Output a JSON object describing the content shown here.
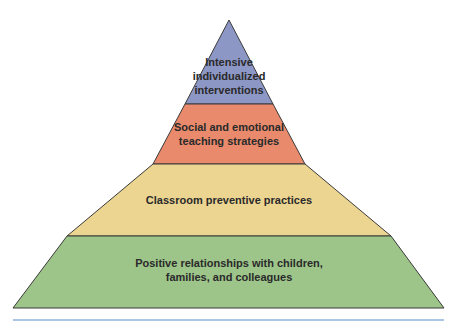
{
  "diagram": {
    "type": "pyramid",
    "tiers": [
      {
        "label_line1": "Intensive",
        "label_line2": "individualized",
        "label_line3": "interventions",
        "color": "#8d97c6"
      },
      {
        "label_line1": "Social and emotional",
        "label_line2": "teaching strategies",
        "color": "#e98a6c"
      },
      {
        "label_line1": "Classroom preventive practices",
        "color": "#ecd591"
      },
      {
        "label_line1": "Positive relationships with children,",
        "label_line2": "families, and colleagues",
        "color": "#9dc489"
      }
    ],
    "outline_color": "#3a3a3a",
    "rule_color": "#a9c6e4"
  }
}
